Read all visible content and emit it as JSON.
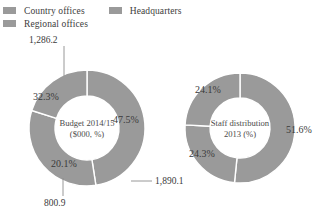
{
  "legend": {
    "items": [
      {
        "label": "Country offices",
        "color": "#9a9a9a",
        "icon": "legend-swatch-icon"
      },
      {
        "label": "Headquarters",
        "color": "#9a9a9a",
        "icon": "legend-swatch-icon"
      },
      {
        "label": "Regional offices",
        "color": "#9a9a9a",
        "icon": "legend-swatch-icon"
      }
    ]
  },
  "chart_data": [
    {
      "type": "pie",
      "title": "Budget 2014/15",
      "subtitle": "($000, %)",
      "center_label_line1": "Budget 2014/15",
      "center_label_line2": "($000, %)",
      "categories": [
        "Country offices",
        "Headquarters",
        "Regional offices"
      ],
      "values": [
        1890.1,
        1286.2,
        800.9
      ],
      "percentages": [
        47.5,
        32.3,
        20.1
      ],
      "value_labels": [
        "1,890.1",
        "1,286.2",
        "800.9"
      ],
      "percent_labels": [
        "47.5%",
        "32.3%",
        "20.1%"
      ],
      "colors": [
        "#9a9a9a",
        "#9a9a9a",
        "#9a9a9a"
      ],
      "donut": true,
      "legend_position": "top"
    },
    {
      "type": "pie",
      "title": "Staff distribution",
      "subtitle": "2013 (%)",
      "center_label_line1": "Staff distribution",
      "center_label_line2": "2013 (%)",
      "categories": [
        "Country offices",
        "Regional offices",
        "Headquarters"
      ],
      "values": [
        51.6,
        24.3,
        24.1
      ],
      "percentages": [
        51.6,
        24.3,
        24.1
      ],
      "percent_labels": [
        "51.6%",
        "24.3%",
        "24.1%"
      ],
      "colors": [
        "#9a9a9a",
        "#9a9a9a",
        "#9a9a9a"
      ],
      "donut": true,
      "legend_position": "top"
    }
  ]
}
